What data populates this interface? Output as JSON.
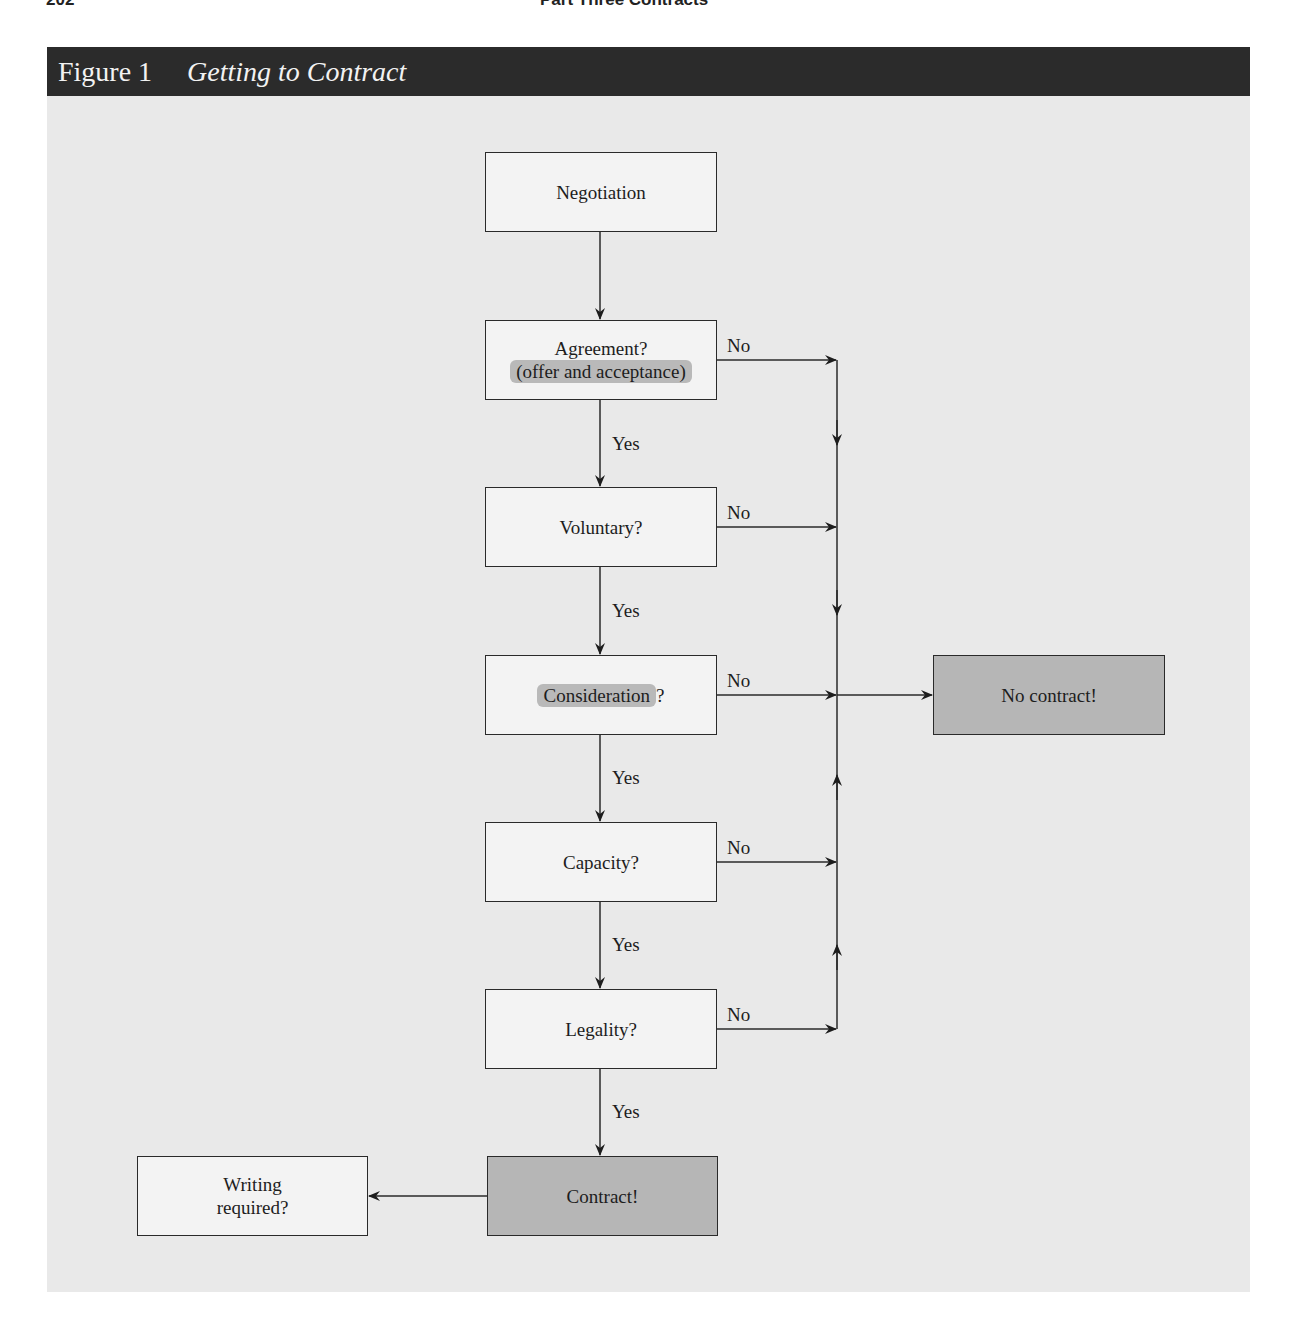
{
  "page": {
    "number": "202",
    "running_head": "Part Three Contracts"
  },
  "figure": {
    "number": "Figure 1",
    "title": "Getting to Contract"
  },
  "nodes": {
    "negotiation": "Negotiation",
    "agreement_line1": "Agreement?",
    "agreement_line2": "(offer and acceptance)",
    "voluntary": "Voluntary?",
    "consideration": "Consideration",
    "consideration_q": "?",
    "capacity": "Capacity?",
    "legality": "Legality?",
    "contract": "Contract!",
    "no_contract": "No contract!",
    "writing_line1": "Writing",
    "writing_line2": "required?"
  },
  "edge_labels": {
    "yes": "Yes",
    "no": "No"
  },
  "colors": {
    "header_bg": "#2b2b2b",
    "panel_bg": "#e9e9e9",
    "box_white": "#f3f3f3",
    "box_shaded": "#b6b6b6",
    "highlight": "#b9b9b9"
  }
}
